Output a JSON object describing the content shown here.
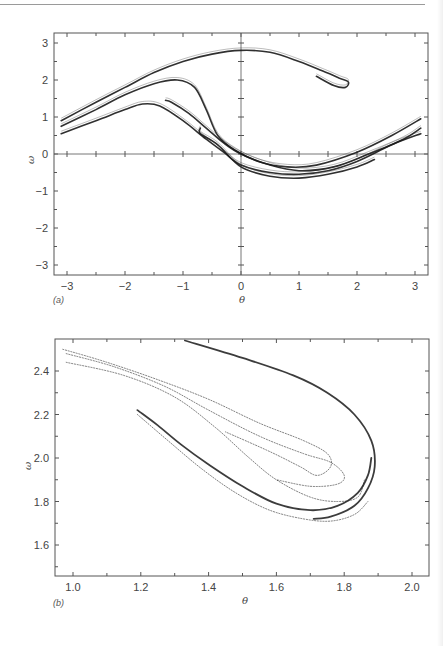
{
  "chart_data": [
    {
      "id": "a",
      "type": "scatter",
      "panel_label": "(a)",
      "title": "",
      "xlabel": "θ",
      "ylabel": "ω",
      "xlim": [
        -3.25,
        3.2
      ],
      "ylim": [
        -3.3,
        3.3
      ],
      "xticks": [
        -3,
        -2,
        -1,
        0,
        1,
        2,
        3
      ],
      "xtick_labels": [
        "−3",
        "−2",
        "−1",
        "0",
        "1",
        "2",
        "3"
      ],
      "yticks": [
        3,
        2,
        1,
        0,
        -1,
        -2,
        -3
      ],
      "ytick_labels": [
        "3",
        "2",
        "1",
        "0",
        "−1",
        "−2",
        "−3"
      ],
      "grid": false,
      "zero_lines": true,
      "description": "Poincaré section (strange attractor) of a driven damped pendulum; points form nested folded bands.",
      "series": [
        {
          "name": "outer band (upper)",
          "points": [
            [
              -3.1,
              0.9
            ],
            [
              -2.5,
              1.4
            ],
            [
              -2,
              1.8
            ],
            [
              -1.5,
              2.2
            ],
            [
              -1,
              2.5
            ],
            [
              -0.5,
              2.7
            ],
            [
              0,
              2.8
            ],
            [
              0.5,
              2.75
            ],
            [
              1,
              2.5
            ],
            [
              1.4,
              2.25
            ],
            [
              1.7,
              2.05
            ],
            [
              1.85,
              1.95
            ],
            [
              1.8,
              1.8
            ],
            [
              1.6,
              1.85
            ],
            [
              1.3,
              2.1
            ]
          ]
        },
        {
          "name": "middle band",
          "points": [
            [
              -3.1,
              0.75
            ],
            [
              -2.5,
              1.2
            ],
            [
              -2,
              1.6
            ],
            [
              -1.5,
              1.9
            ],
            [
              -1.1,
              2.0
            ],
            [
              -0.8,
              1.8
            ],
            [
              -0.6,
              1.2
            ],
            [
              -0.4,
              0.5
            ],
            [
              -0.1,
              0.1
            ],
            [
              0.3,
              -0.2
            ],
            [
              0.8,
              -0.35
            ],
            [
              1.3,
              -0.3
            ],
            [
              2,
              0.05
            ],
            [
              2.6,
              0.5
            ],
            [
              3.1,
              0.95
            ]
          ]
        },
        {
          "name": "lower band",
          "points": [
            [
              -3.1,
              0.55
            ],
            [
              -2.5,
              0.9
            ],
            [
              -2,
              1.2
            ],
            [
              -1.7,
              1.35
            ],
            [
              -1.4,
              1.3
            ],
            [
              -1,
              0.9
            ],
            [
              -0.6,
              0.4
            ],
            [
              -0.3,
              0.05
            ],
            [
              0,
              -0.3
            ],
            [
              0.5,
              -0.5
            ],
            [
              1,
              -0.55
            ],
            [
              1.5,
              -0.45
            ],
            [
              2,
              -0.2
            ],
            [
              2.6,
              0.25
            ],
            [
              3.1,
              0.55
            ]
          ]
        },
        {
          "name": "inner fold",
          "points": [
            [
              -1.3,
              1.45
            ],
            [
              -1.2,
              1.4
            ],
            [
              -0.9,
              1.1
            ],
            [
              -0.6,
              0.7
            ],
            [
              -0.3,
              0.3
            ],
            [
              0,
              0.0
            ],
            [
              0.5,
              -0.3
            ],
            [
              1,
              -0.45
            ],
            [
              1.6,
              -0.35
            ],
            [
              2.2,
              0.0
            ],
            [
              2.8,
              0.4
            ],
            [
              3.1,
              0.7
            ]
          ]
        },
        {
          "name": "lowest strands",
          "points": [
            [
              -0.7,
              0.7
            ],
            [
              -0.7,
              0.55
            ],
            [
              -0.4,
              0.25
            ],
            [
              0,
              -0.35
            ],
            [
              0.5,
              -0.6
            ],
            [
              1,
              -0.65
            ],
            [
              1.5,
              -0.55
            ],
            [
              2,
              -0.35
            ],
            [
              2.3,
              -0.15
            ]
          ]
        }
      ]
    },
    {
      "id": "b",
      "type": "scatter",
      "panel_label": "(b)",
      "title": "",
      "xlabel": "θ",
      "ylabel": "ω",
      "xlim": [
        0.95,
        2.05
      ],
      "ylim": [
        1.45,
        2.54
      ],
      "xticks": [
        1.0,
        1.2,
        1.4,
        1.6,
        1.8,
        2.0
      ],
      "xtick_labels": [
        "1.0",
        "1.2",
        "1.4",
        "1.6",
        "1.8",
        "2.0"
      ],
      "yticks": [
        2.4,
        2.2,
        2.0,
        1.8,
        1.6
      ],
      "ytick_labels": [
        "2.4",
        "2.2",
        "2.0",
        "1.8",
        "1.6"
      ],
      "grid": false,
      "description": "Magnified view of the fold region of panel (a), showing self-similar layered structure.",
      "series": [
        {
          "name": "outer strand",
          "points": [
            [
              1.33,
              2.54
            ],
            [
              1.5,
              2.46
            ],
            [
              1.65,
              2.38
            ],
            [
              1.75,
              2.3
            ],
            [
              1.83,
              2.2
            ],
            [
              1.88,
              2.08
            ],
            [
              1.89,
              1.96
            ],
            [
              1.87,
              1.86
            ],
            [
              1.83,
              1.78
            ],
            [
              1.76,
              1.73
            ],
            [
              1.71,
              1.72
            ]
          ]
        },
        {
          "name": "strand 2",
          "points": [
            [
              0.97,
              2.5
            ],
            [
              1.1,
              2.44
            ],
            [
              1.25,
              2.36
            ],
            [
              1.4,
              2.27
            ],
            [
              1.55,
              2.16
            ],
            [
              1.68,
              2.08
            ],
            [
              1.75,
              2.02
            ],
            [
              1.76,
              1.96
            ],
            [
              1.72,
              1.92
            ],
            [
              1.67,
              1.96
            ],
            [
              1.58,
              2.03
            ],
            [
              1.45,
              2.12
            ]
          ]
        },
        {
          "name": "strand 3",
          "points": [
            [
              0.98,
              2.48
            ],
            [
              1.12,
              2.42
            ],
            [
              1.27,
              2.33
            ],
            [
              1.4,
              2.22
            ],
            [
              1.55,
              2.1
            ],
            [
              1.68,
              2.02
            ],
            [
              1.76,
              1.98
            ],
            [
              1.8,
              1.92
            ],
            [
              1.78,
              1.88
            ],
            [
              1.7,
              1.87
            ],
            [
              1.6,
              1.9
            ]
          ]
        },
        {
          "name": "strand 4",
          "points": [
            [
              0.98,
              2.44
            ],
            [
              1.15,
              2.38
            ],
            [
              1.3,
              2.28
            ],
            [
              1.42,
              2.14
            ],
            [
              1.52,
              2.0
            ],
            [
              1.6,
              1.9
            ],
            [
              1.7,
              1.82
            ],
            [
              1.78,
              1.8
            ],
            [
              1.84,
              1.82
            ],
            [
              1.86,
              1.9
            ]
          ]
        },
        {
          "name": "dense strand",
          "points": [
            [
              1.19,
              2.22
            ],
            [
              1.25,
              2.15
            ],
            [
              1.32,
              2.06
            ],
            [
              1.4,
              1.97
            ],
            [
              1.5,
              1.87
            ],
            [
              1.6,
              1.79
            ],
            [
              1.7,
              1.76
            ],
            [
              1.78,
              1.78
            ],
            [
              1.84,
              1.84
            ],
            [
              1.87,
              1.92
            ],
            [
              1.88,
              2.0
            ]
          ]
        },
        {
          "name": "inner strand",
          "points": [
            [
              1.19,
              2.2
            ],
            [
              1.28,
              2.08
            ],
            [
              1.38,
              1.95
            ],
            [
              1.48,
              1.84
            ],
            [
              1.58,
              1.76
            ],
            [
              1.68,
              1.72
            ],
            [
              1.76,
              1.71
            ],
            [
              1.83,
              1.74
            ],
            [
              1.87,
              1.8
            ]
          ]
        }
      ]
    }
  ]
}
